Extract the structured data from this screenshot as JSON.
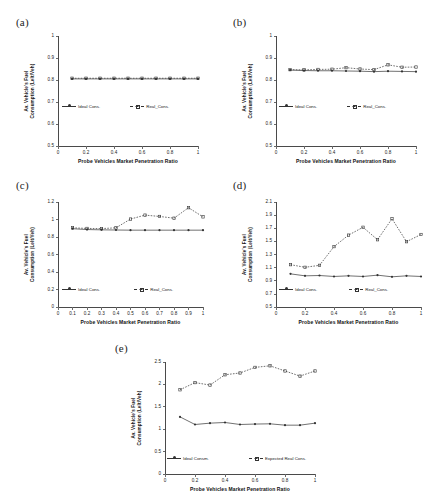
{
  "figure": {
    "background": "#ffffff",
    "line_color": "#333333"
  },
  "common": {
    "xlabel": "Probe Vehicles Market Penetration Ratio",
    "ylabel_line1": "Av. Vehicle's Fuel",
    "ylabel_line2": "Consumption  (Lelt/Veh)",
    "legend_ideal": "Ideal Cons.",
    "legend_real": "Real_Cons.",
    "legend_ideal_e": "Ideal Consm.",
    "legend_real_e": "Expected Real Cons."
  },
  "panels": [
    {
      "id": "a",
      "label": "(a)"
    },
    {
      "id": "b",
      "label": "(b)"
    },
    {
      "id": "c",
      "label": "(c)"
    },
    {
      "id": "d",
      "label": "(d)"
    },
    {
      "id": "e",
      "label": "(e)"
    }
  ],
  "chart_data": [
    {
      "id": "a",
      "type": "line",
      "title": "(a)",
      "xlabel": "Probe Vehicles Market Penetration Ratio",
      "ylabel": "Av. Vehicle's Fuel Consumption  (Lelt/Veh)",
      "xlim": [
        0,
        1
      ],
      "ylim": [
        0.5,
        1
      ],
      "xticks": [
        0,
        0.2,
        0.4,
        0.6,
        0.8,
        1
      ],
      "xticklabels": [
        "0",
        "0.2",
        "0.4",
        "0.6",
        "0.8",
        "1"
      ],
      "yticks": [
        0.5,
        0.6,
        0.7,
        0.8,
        0.9,
        1
      ],
      "yticklabels": [
        "0.5",
        "0.6",
        "0.7",
        "0.8",
        "0.9",
        "1"
      ],
      "grid": false,
      "legend_position": "center",
      "x": [
        0.1,
        0.2,
        0.3,
        0.4,
        0.5,
        0.6,
        0.7,
        0.8,
        0.9,
        1.0
      ],
      "series": [
        {
          "name": "Ideal Cons.",
          "style": "solid",
          "marker": "dot",
          "values": [
            0.805,
            0.805,
            0.805,
            0.805,
            0.805,
            0.805,
            0.805,
            0.805,
            0.805,
            0.805
          ]
        },
        {
          "name": "Real_Cons.",
          "style": "dashed",
          "marker": "cross",
          "values": [
            0.808,
            0.808,
            0.808,
            0.808,
            0.808,
            0.808,
            0.808,
            0.808,
            0.808,
            0.808
          ]
        }
      ]
    },
    {
      "id": "b",
      "type": "line",
      "title": "(b)",
      "xlabel": "Probe Vehicles Market Penetration Ratio",
      "ylabel": "Av. Vehicle's Fuel Consumption  (Lelt/Veh)",
      "xlim": [
        0,
        1
      ],
      "ylim": [
        0.5,
        1
      ],
      "xticks": [
        0,
        0.2,
        0.4,
        0.6,
        0.8,
        1
      ],
      "xticklabels": [
        "0",
        "0.2",
        "0.4",
        "0.6",
        "0.8",
        "1"
      ],
      "yticks": [
        0.5,
        0.6,
        0.7,
        0.8,
        0.9,
        1
      ],
      "yticklabels": [
        "0.5",
        "0.6",
        "0.7",
        "0.8",
        "0.9",
        "1"
      ],
      "grid": false,
      "legend_position": "center",
      "x": [
        0.1,
        0.2,
        0.3,
        0.4,
        0.5,
        0.6,
        0.7,
        0.8,
        0.9,
        1.0
      ],
      "series": [
        {
          "name": "Ideal Cons.",
          "style": "solid",
          "marker": "dot",
          "values": [
            0.845,
            0.843,
            0.842,
            0.842,
            0.841,
            0.84,
            0.838,
            0.84,
            0.839,
            0.838
          ]
        },
        {
          "name": "Real_Cons.",
          "style": "dashed",
          "marker": "cross",
          "values": [
            0.847,
            0.846,
            0.848,
            0.849,
            0.856,
            0.85,
            0.847,
            0.869,
            0.858,
            0.859
          ]
        }
      ]
    },
    {
      "id": "c",
      "type": "line",
      "title": "(c)",
      "xlabel": "Probe Vehicles Market Penetration Ratio",
      "ylabel": "Av. Vehicle's Fuel Consumption  (Lelt/Veh)",
      "xlim": [
        0,
        1
      ],
      "ylim": [
        0,
        1.2
      ],
      "xticks": [
        0,
        0.1,
        0.2,
        0.3,
        0.4,
        0.5,
        0.6,
        0.7,
        0.8,
        0.9,
        1
      ],
      "xticklabels": [
        "0",
        "0.1",
        "0.2",
        "0.3",
        "0.4",
        "0.5",
        "0.6",
        "0.7",
        "0.8",
        "0.9",
        "1"
      ],
      "yticks": [
        0,
        0.2,
        0.4,
        0.6,
        0.8,
        1,
        1.2
      ],
      "yticklabels": [
        "0",
        "0.2",
        "0.4",
        "0.6",
        "0.8",
        "1",
        "1.2"
      ],
      "grid": false,
      "legend_position": "center",
      "x": [
        0.1,
        0.2,
        0.3,
        0.4,
        0.5,
        0.6,
        0.7,
        0.8,
        0.9,
        1.0
      ],
      "series": [
        {
          "name": "Ideal Cons.",
          "style": "solid",
          "marker": "dot",
          "values": [
            0.895,
            0.885,
            0.882,
            0.88,
            0.878,
            0.878,
            0.878,
            0.878,
            0.878,
            0.878
          ]
        },
        {
          "name": "Real_Cons.",
          "style": "dashed",
          "marker": "cross",
          "values": [
            0.905,
            0.898,
            0.896,
            0.905,
            1.005,
            1.05,
            1.035,
            1.015,
            1.135,
            1.03
          ]
        }
      ]
    },
    {
      "id": "d",
      "type": "line",
      "title": "(d)",
      "xlabel": "Probe Vehicles Market Penetration Ratio",
      "ylabel": "Av. Vehicle's Fuel Consumption  (Lelt/Veh)",
      "xlim": [
        0,
        1
      ],
      "ylim": [
        0.5,
        2.1
      ],
      "xticks": [
        0,
        0.2,
        0.4,
        0.6,
        0.8,
        1
      ],
      "xticklabels": [
        "0",
        "0.2",
        "0.4",
        "0.6",
        "0.8",
        "1"
      ],
      "yticks": [
        0.5,
        0.7,
        0.9,
        1.1,
        1.3,
        1.5,
        1.7,
        1.9,
        2.1
      ],
      "yticklabels": [
        "0.5",
        "0.7",
        "0.9",
        "1.1",
        "1.3",
        "1.5",
        "1.7",
        "1.9",
        "2.1"
      ],
      "grid": false,
      "legend_position": "center",
      "x": [
        0.1,
        0.2,
        0.3,
        0.4,
        0.5,
        0.6,
        0.7,
        0.8,
        0.9,
        1.0
      ],
      "series": [
        {
          "name": "Ideal Cons.",
          "style": "solid",
          "marker": "dot",
          "values": [
            1.005,
            0.975,
            0.98,
            0.965,
            0.975,
            0.965,
            0.985,
            0.96,
            0.975,
            0.965
          ]
        },
        {
          "name": "Real_Cons.",
          "style": "dashed",
          "marker": "cross",
          "values": [
            1.145,
            1.105,
            1.135,
            1.42,
            1.595,
            1.715,
            1.525,
            1.845,
            1.495,
            1.605
          ]
        }
      ]
    },
    {
      "id": "e",
      "type": "line",
      "title": "(e)",
      "xlabel": "Probe Vehicles Market Penetration Ratio",
      "ylabel": "Av. Vehicle's Fuel Consumption  (Lelt/Veh)",
      "xlim": [
        0,
        1
      ],
      "ylim": [
        0,
        2.5
      ],
      "xticks": [
        0,
        0.2,
        0.4,
        0.6,
        0.8,
        1
      ],
      "xticklabels": [
        "0",
        "0.2",
        "0.4",
        "0.6",
        "0.8",
        "1"
      ],
      "yticks": [
        0,
        0.5,
        1,
        1.5,
        2,
        2.5
      ],
      "yticklabels": [
        "0",
        "0.5",
        "1",
        "1.5",
        "2",
        "2.5"
      ],
      "grid": false,
      "legend_position": "center",
      "x": [
        0.1,
        0.2,
        0.3,
        0.4,
        0.5,
        0.6,
        0.7,
        0.8,
        0.9,
        1.0
      ],
      "series": [
        {
          "name": "Ideal Consm.",
          "style": "solid",
          "marker": "dot",
          "values": [
            1.275,
            1.105,
            1.135,
            1.15,
            1.105,
            1.115,
            1.12,
            1.09,
            1.09,
            1.135
          ]
        },
        {
          "name": "Expected Real Cons.",
          "style": "dashed",
          "marker": "cross",
          "values": [
            1.88,
            2.04,
            1.985,
            2.215,
            2.255,
            2.38,
            2.415,
            2.3,
            2.185,
            2.3
          ]
        }
      ]
    }
  ]
}
